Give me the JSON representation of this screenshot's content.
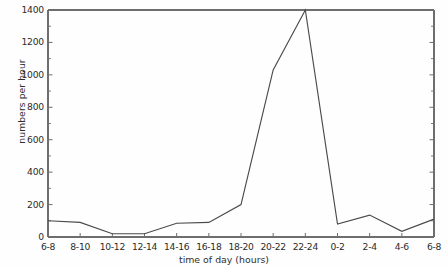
{
  "chart_data": {
    "type": "line",
    "title": "",
    "xlabel": "time of day (hours)",
    "ylabel": "numbers per hour",
    "categories": [
      "6-8",
      "8-10",
      "10-12",
      "12-14",
      "14-16",
      "16-18",
      "18-20",
      "20-22",
      "22-24",
      "0-2",
      "2-4",
      "4-6",
      "6-8"
    ],
    "values": [
      100,
      90,
      20,
      20,
      85,
      90,
      200,
      1030,
      1400,
      80,
      135,
      35,
      110
    ],
    "ylim": [
      0,
      1400
    ],
    "ytick_major": [
      0,
      200,
      400,
      600,
      800,
      1000,
      1200,
      1400
    ],
    "ytick_major_labels": [
      "0",
      "200",
      "400",
      "600",
      "800",
      "1000",
      "1200",
      "1400"
    ],
    "ytick_minor": [
      100,
      300,
      500,
      700,
      900,
      1100,
      1300
    ],
    "grid": false,
    "legend": "none",
    "line_color": "#4a4a4a",
    "frame_color": "#6e6e6e",
    "background_color": "#fefefe"
  }
}
